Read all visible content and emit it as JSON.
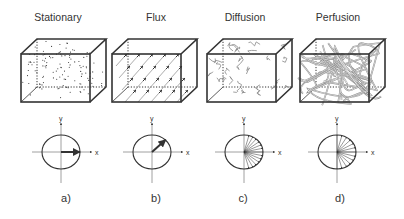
{
  "figure": {
    "panels": [
      {
        "id": "a",
        "title": "Stationary",
        "label": "a)",
        "cube_x": 21,
        "circle_cx": 61,
        "content": "dots",
        "vector": "single-arrow-along-x"
      },
      {
        "id": "b",
        "title": "Flux",
        "label": "b)",
        "cube_x": 112,
        "circle_cx": 152,
        "content": "parallel-arrows",
        "vector": "single-arrow-45deg"
      },
      {
        "id": "c",
        "title": "Diffusion",
        "label": "c)",
        "cube_x": 207,
        "circle_cx": 244,
        "content": "short-random-paths",
        "vector": "fan-of-arrows-right-half-partial"
      },
      {
        "id": "d",
        "title": "Perfusion",
        "label": "d)",
        "cube_x": 300,
        "circle_cx": 337,
        "content": "long-tangled-vessels",
        "vector": "fan-of-arrows-right-half-full"
      }
    ],
    "axis_labels": {
      "x": "x",
      "y": "y"
    },
    "colors": {
      "line": "#333333",
      "light_line": "#888888",
      "background": "#ffffff"
    }
  }
}
